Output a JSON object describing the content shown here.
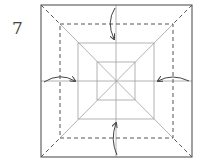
{
  "diagram": {
    "step_number": "7",
    "type": "origami-fold-step",
    "colors": {
      "outline": "#555555",
      "crease": "#9a9a9a",
      "dashed": "#555555",
      "arrow": "#444444"
    },
    "elements": {
      "outer_square": "paper-outline",
      "dashed_square": "valley-fold-lines",
      "arrows": [
        "top-fold-arrow",
        "right-fold-arrow",
        "bottom-fold-arrow",
        "left-fold-arrow"
      ]
    }
  }
}
